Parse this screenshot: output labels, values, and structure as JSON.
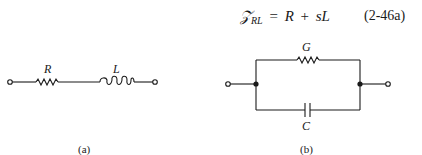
{
  "equation": {
    "symbol": "𝒵",
    "subscript": "RL",
    "equals": "=",
    "lhs_term1": "R",
    "plus": "+",
    "lhs_term2": "sL",
    "number": "(2-46a)"
  },
  "circuit_a": {
    "caption": "(a)",
    "components": [
      {
        "type": "resistor",
        "label": "R"
      },
      {
        "type": "inductor",
        "label": "L"
      }
    ],
    "topology": "series"
  },
  "circuit_b": {
    "caption": "(b)",
    "components": [
      {
        "type": "resistor",
        "label": "G"
      },
      {
        "type": "capacitor",
        "label": "C"
      }
    ],
    "topology": "parallel"
  }
}
